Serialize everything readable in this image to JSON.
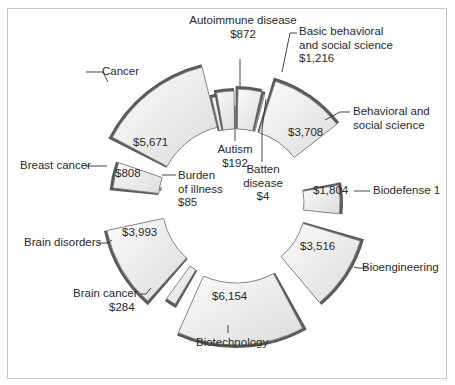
{
  "chart_data": {
    "type": "radial-bar",
    "title": "",
    "unit": "$ (millions)",
    "categories": [
      "Autism",
      "Autoimmune disease",
      "Basic behavioral and social science",
      "Batten disease",
      "Behavioral and social science",
      "Biodefense 1",
      "Bioengineering",
      "Biotechnology",
      "Brain cancer",
      "Brain disorders",
      "Burden of illness",
      "Breast cancer",
      "Cancer"
    ],
    "values": [
      192,
      872,
      1216,
      4,
      3708,
      1804,
      3516,
      6154,
      284,
      3993,
      85,
      808,
      5671
    ],
    "value_labels": [
      "$192",
      "$872",
      "$1,216",
      "$4",
      "$3,708",
      "$1,804",
      "$3,516",
      "$6,154",
      "$284",
      "$3,993",
      "$85",
      "$808",
      "$5,671"
    ],
    "grid": false,
    "legend": "none (direct callout labels)"
  },
  "colors": {
    "segment_fill_light": "#f4f4f4",
    "segment_fill_dark": "#d6d6d6",
    "segment_edge": "#5a5a5a",
    "segment_outline": "#777777",
    "frame": "#c8c8c8",
    "text": "#2a2a2a"
  },
  "labels": {
    "cancer": "Cancer",
    "cancer_value": "$5,671",
    "autoimmune": "Autoimmune disease",
    "autoimmune_value": "$872",
    "basic_behavioral_1": "Basic behavioral",
    "basic_behavioral_2": "and social science",
    "basic_behavioral_value": "$1,216",
    "autism": "Autism",
    "autism_value": "$192",
    "behavioral_1": "Behavioral and",
    "behavioral_2": "social science",
    "behavioral_value": "$3,708",
    "batten_1": "Batten",
    "batten_2": "disease",
    "batten_value": "$4",
    "breast_cancer": "Breast cancer",
    "breast_cancer_value": "$808",
    "burden_1": "Burden",
    "burden_2": "of illness",
    "burden_value": "$85",
    "biodefense": "Biodefense 1",
    "biodefense_value": "$1,804",
    "brain_disorders": "Brain disorders",
    "brain_disorders_value": "$3,993",
    "bioengineering": "Bioengineering",
    "bioengineering_value": "$3,516",
    "brain_cancer": "Brain cancer",
    "brain_cancer_value": "$284",
    "biotechnology": "Biotechnology",
    "biotechnology_value": "$6,154"
  },
  "segments": [
    {
      "name": "autism",
      "a0": -13,
      "a1": -10.5,
      "r0": 74,
      "r1": 108
    },
    {
      "name": "autoimmune",
      "a0": -10,
      "a1": -1,
      "r0": 74,
      "r1": 112
    },
    {
      "name": "basic-behavioral",
      "a0": 1,
      "a1": 13,
      "r0": 74,
      "r1": 114
    },
    {
      "name": "batten",
      "a0": 14.2,
      "a1": 14.8,
      "r0": 74,
      "r1": 112
    },
    {
      "name": "behavioral",
      "a0": 18,
      "a1": 52,
      "r0": 74,
      "r1": 128
    },
    {
      "name": "biodefense",
      "a0": 80,
      "a1": 96,
      "r0": 68,
      "r1": 104
    },
    {
      "name": "bioengineering",
      "a0": 107,
      "a1": 140,
      "r0": 70,
      "r1": 130
    },
    {
      "name": "biotechnology",
      "a0": 152,
      "a1": 204,
      "r0": 80,
      "r1": 142
    },
    {
      "name": "brain-cancer",
      "a0": 211,
      "a1": 216,
      "r0": 78,
      "r1": 118
    },
    {
      "name": "brain-disorders",
      "a0": 222,
      "a1": 258,
      "r0": 74,
      "r1": 132
    },
    {
      "name": "burden",
      "a0": 280.5,
      "a1": 281.5,
      "r0": 76,
      "r1": 118
    },
    {
      "name": "breast-cancer",
      "a0": 277,
      "a1": 289,
      "r0": 78,
      "r1": 124
    },
    {
      "name": "cancer",
      "a0": 298,
      "a1": 346,
      "r0": 78,
      "r1": 140
    }
  ]
}
